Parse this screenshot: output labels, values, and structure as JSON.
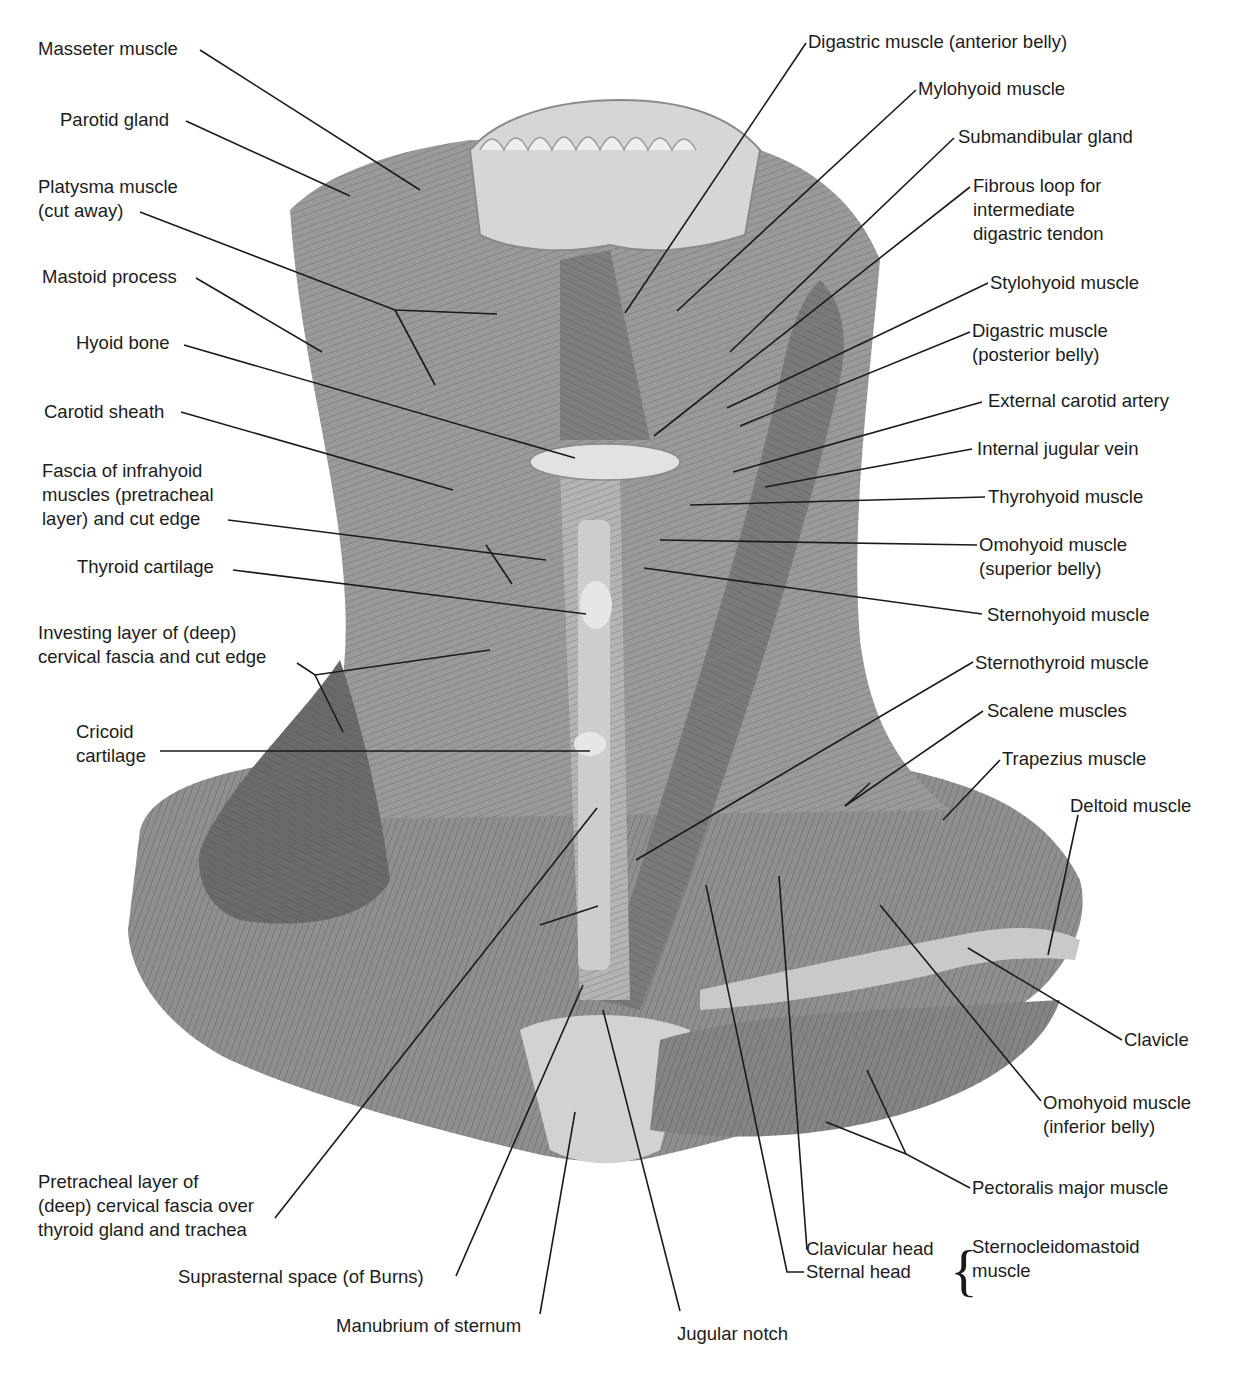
{
  "figure": {
    "labels_left": [
      {
        "id": "masseter",
        "text": "Masseter muscle",
        "x": 38,
        "y": 37
      },
      {
        "id": "parotid",
        "text": "Parotid gland",
        "x": 60,
        "y": 108
      },
      {
        "id": "platysma",
        "text": "Platysma muscle\n(cut away)",
        "x": 38,
        "y": 175
      },
      {
        "id": "mastoid",
        "text": "Mastoid process",
        "x": 42,
        "y": 265
      },
      {
        "id": "hyoid",
        "text": "Hyoid bone",
        "x": 76,
        "y": 331
      },
      {
        "id": "carotid-sheath",
        "text": "Carotid sheath",
        "x": 44,
        "y": 400
      },
      {
        "id": "fascia-infrahyoid",
        "text": "Fascia of infrahyoid\nmuscles (pretracheal\nlayer) and cut edge",
        "x": 42,
        "y": 459
      },
      {
        "id": "thyroid-cartilage",
        "text": "Thyroid cartilage",
        "x": 77,
        "y": 555
      },
      {
        "id": "investing-layer",
        "text": "Investing layer of (deep)\ncervical fascia and cut edge",
        "x": 38,
        "y": 621
      },
      {
        "id": "cricoid",
        "text": "Cricoid\ncartilage",
        "x": 76,
        "y": 720
      },
      {
        "id": "pretracheal-layer",
        "text": "Pretracheal layer of\n(deep) cervical fascia over\nthyroid gland and trachea",
        "x": 38,
        "y": 1170
      },
      {
        "id": "suprasternal",
        "text": "Suprasternal space (of Burns)",
        "x": 178,
        "y": 1265
      },
      {
        "id": "manubrium",
        "text": "Manubrium of sternum",
        "x": 336,
        "y": 1314
      }
    ],
    "labels_right": [
      {
        "id": "digastric-anterior",
        "text": "Digastric muscle (anterior belly)",
        "x": 808,
        "y": 30
      },
      {
        "id": "mylohyoid",
        "text": "Mylohyoid muscle",
        "x": 918,
        "y": 77
      },
      {
        "id": "submandibular",
        "text": "Submandibular gland",
        "x": 958,
        "y": 125
      },
      {
        "id": "fibrous-loop",
        "text": "Fibrous loop for\nintermediate\ndigastric tendon",
        "x": 973,
        "y": 174
      },
      {
        "id": "stylohyoid",
        "text": "Stylohyoid muscle",
        "x": 990,
        "y": 271
      },
      {
        "id": "digastric-posterior",
        "text": "Digastric muscle\n(posterior belly)",
        "x": 972,
        "y": 319
      },
      {
        "id": "ext-carotid",
        "text": "External carotid artery",
        "x": 988,
        "y": 389
      },
      {
        "id": "int-jugular",
        "text": "Internal jugular vein",
        "x": 977,
        "y": 437
      },
      {
        "id": "thyrohyoid",
        "text": "Thyrohyoid muscle",
        "x": 988,
        "y": 485
      },
      {
        "id": "omohyoid-superior",
        "text": "Omohyoid muscle\n(superior belly)",
        "x": 979,
        "y": 533
      },
      {
        "id": "sternohyoid",
        "text": "Sternohyoid muscle",
        "x": 987,
        "y": 603
      },
      {
        "id": "sternothyroid",
        "text": "Sternothyroid muscle",
        "x": 975,
        "y": 651
      },
      {
        "id": "scalene",
        "text": "Scalene muscles",
        "x": 987,
        "y": 699
      },
      {
        "id": "trapezius",
        "text": "Trapezius muscle",
        "x": 1002,
        "y": 747
      },
      {
        "id": "deltoid",
        "text": "Deltoid muscle",
        "x": 1070,
        "y": 794
      },
      {
        "id": "clavicle",
        "text": "Clavicle",
        "x": 1124,
        "y": 1028
      },
      {
        "id": "omohyoid-inferior",
        "text": "Omohyoid muscle\n(inferior belly)",
        "x": 1043,
        "y": 1091
      },
      {
        "id": "pectoralis",
        "text": "Pectoralis major muscle",
        "x": 972,
        "y": 1176
      },
      {
        "id": "clavicular-head",
        "text": "Clavicular head",
        "x": 806,
        "y": 1237
      },
      {
        "id": "sternal-head",
        "text": "Sternal head",
        "x": 806,
        "y": 1260
      },
      {
        "id": "scm",
        "text": "Sternocleidomastoid\nmuscle",
        "x": 972,
        "y": 1235
      },
      {
        "id": "jugular-notch",
        "text": "Jugular notch",
        "x": 677,
        "y": 1322
      }
    ],
    "brace_symbol": "{",
    "colors": {
      "line": "#1a1a1a",
      "muscle_dark": "#5e5e5e",
      "muscle_mid": "#8a8a8a",
      "muscle_light": "#b8b8b8",
      "bone": "#dedede",
      "background": "#ffffff"
    }
  }
}
